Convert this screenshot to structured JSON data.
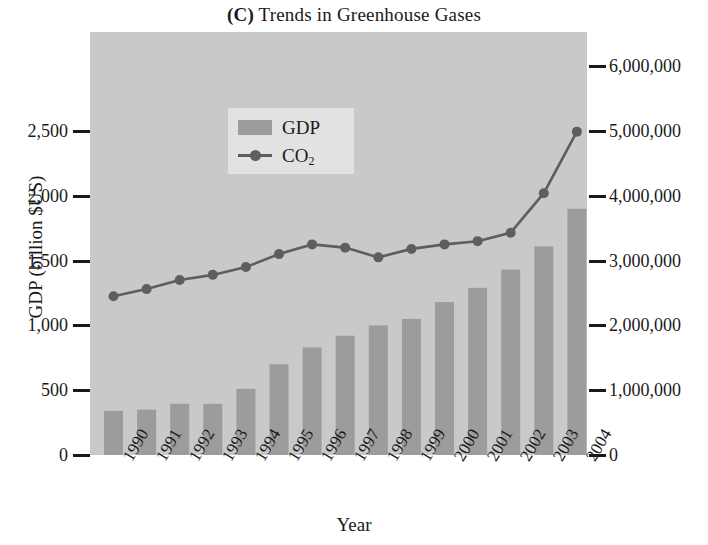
{
  "title": {
    "panel": "(C)",
    "text": " Trends in Greenhouse Gases"
  },
  "axes": {
    "x_title": "Year",
    "y_left_title": "GDP (billion $US)",
    "y_right_title_main": "CO",
    "y_right_title_sub": "2",
    "y_right_title_rest": " (thousand metric tons)",
    "y_left_ticks": [
      "2,500",
      "2,000",
      "1,500",
      "1,000",
      "500",
      "0"
    ],
    "y_right_ticks": [
      "6,000,000",
      "5,000,000",
      "4,000,000",
      "3,000,000",
      "2,000,000",
      "1,000,000",
      "0"
    ]
  },
  "legend": {
    "gdp_label": "GDP",
    "co2_label_main": "CO",
    "co2_label_sub": "2"
  },
  "colors": {
    "plot_background": "#c9c9c9",
    "bar_fill": "#9c9c9c",
    "line_color": "#5e5e5e",
    "legend_background": "#e2e2e2",
    "text": "#1a1a1a"
  },
  "chart_data": {
    "type": "bar",
    "title": "(C) Trends in Greenhouse Gases",
    "xlabel": "Year",
    "ylabel": "GDP (billion $US)",
    "y2label": "CO2 (thousand metric tons)",
    "grid": false,
    "legend_position": "upper-left-inside",
    "ylim": [
      0,
      2750
    ],
    "y2lim": [
      0,
      6500000
    ],
    "categories": [
      "1990",
      "1991",
      "1992",
      "1993",
      "1994",
      "1995",
      "1996",
      "1997",
      "1998",
      "1999",
      "2000",
      "2001",
      "2002",
      "2003",
      "2004"
    ],
    "series": [
      {
        "name": "GDP",
        "type": "bar",
        "axis": "left",
        "unit": "billion $US",
        "values": [
          340,
          350,
          395,
          395,
          510,
          700,
          830,
          920,
          1000,
          1050,
          1180,
          1290,
          1430,
          1610,
          1900
        ]
      },
      {
        "name": "CO2",
        "type": "line",
        "axis": "right",
        "unit": "thousand metric tons",
        "values": [
          2450,
          2560,
          2700,
          2780,
          2900,
          3100,
          3250,
          3200,
          3050,
          3180,
          3250,
          3300,
          3430,
          4040,
          4990
        ]
      }
    ]
  }
}
